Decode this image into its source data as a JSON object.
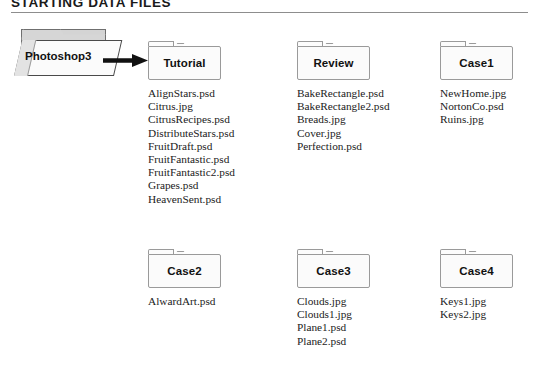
{
  "header": {
    "title": "STARTING DATA FILES"
  },
  "source": {
    "label": "Photoshop3",
    "arrow_icon": "right-arrow-icon",
    "folder_icon": "open-folder-icon"
  },
  "folders": [
    {
      "id": "tutorial",
      "label": "Tutorial",
      "icon": "folder-icon",
      "files": [
        "AlignStars.psd",
        "Citrus.jpg",
        "CitrusRecipes.psd",
        "DistributeStars.psd",
        "FruitDraft.psd",
        "FruitFantastic.psd",
        "FruitFantastic2.psd",
        "Grapes.psd",
        "HeavenSent.psd"
      ]
    },
    {
      "id": "review",
      "label": "Review",
      "icon": "folder-icon",
      "files": [
        "BakeRectangle.psd",
        "BakeRectangle2.psd",
        "Breads.jpg",
        "Cover.jpg",
        "Perfection.psd"
      ]
    },
    {
      "id": "case1",
      "label": "Case1",
      "icon": "folder-icon",
      "files": [
        "NewHome.jpg",
        "NortonCo.psd",
        "Ruins.jpg"
      ]
    },
    {
      "id": "case2",
      "label": "Case2",
      "icon": "folder-icon",
      "files": [
        "AlwardArt.psd"
      ]
    },
    {
      "id": "case3",
      "label": "Case3",
      "icon": "folder-icon",
      "files": [
        "Clouds.jpg",
        "Clouds1.jpg",
        "Plane1.psd",
        "Plane2.psd"
      ]
    },
    {
      "id": "case4",
      "label": "Case4",
      "icon": "folder-icon",
      "files": [
        "Keys1.jpg",
        "Keys2.jpg"
      ]
    }
  ],
  "colors": {
    "rule": "#8d8d8d",
    "folder_border": "#9a9a9a",
    "folder_fill": "#fbfbfb",
    "source_shade": "#d4d4d4",
    "arrow": "#111111",
    "text": "#1b1b1b"
  }
}
